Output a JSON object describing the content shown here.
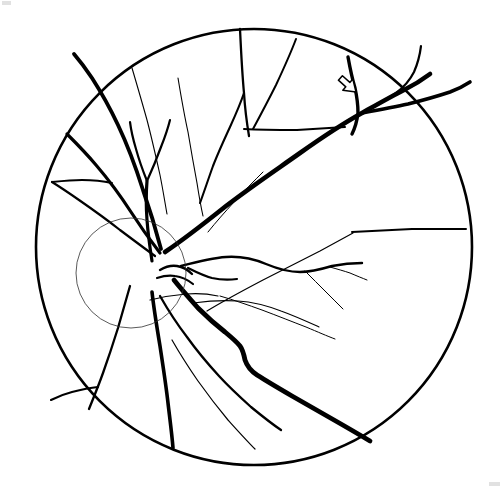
{
  "figure": {
    "title": "Retinal fundus schematic drawing",
    "type": "line-diagram",
    "background_color": "#ffffff",
    "ink_color": "#000000",
    "canvas": {
      "width": 502,
      "height": 489
    }
  },
  "structures": {
    "fundus_boundary": {
      "label": "fundus-circle",
      "center_x": 254,
      "center_y": 247,
      "radius": 218,
      "stroke_width": 2.6,
      "color": "#000000"
    },
    "optic_disc": {
      "label": "optic-disc",
      "center_x": 131,
      "center_y": 273,
      "radius": 55,
      "stroke_width": 1,
      "color": "#2b2b2b"
    },
    "annotation_arrow": {
      "label": "arrow-pointer",
      "tip_x": 356,
      "tip_y": 92,
      "direction": "down-right",
      "style": "hollow-outline",
      "fill": "#ffffff",
      "stroke": "#000000"
    }
  },
  "vessels": {
    "thick_stroke_width": 4.2,
    "medium_stroke_width": 2.2,
    "thin_stroke_width": 1.0,
    "paths": [
      {
        "name": "superotemporal-arcade-major",
        "weight": "thick",
        "width": 4.6,
        "d": "M 165 252 C 186 238 206 222 226 206 C 252 186 276 170 300 153 C 324 136 344 123 362 113 C 378 104 392 96 404 90 C 414 85 422 80 430 74"
      },
      {
        "name": "superotemporal-branch-upper",
        "weight": "medium",
        "width": 2.2,
        "d": "M 362 113 C 374 107 386 100 396 93 C 404 87 410 80 414 72 C 418 63 420 54 421 46"
      },
      {
        "name": "superotemporal-branch-to-periphery",
        "weight": "thick",
        "width": 3.6,
        "d": "M 362 113 C 378 110 394 107 408 104 C 424 100 438 96 450 92 C 458 89 464 86 470 82"
      },
      {
        "name": "arrow-target-vessel",
        "weight": "thick",
        "width": 3.4,
        "d": "M 348 57 C 350 68 352 78 355 88 C 357 97 358 105 358 113 C 357 121 355 128 352 134"
      },
      {
        "name": "superior-trunk-vertical",
        "weight": "medium",
        "width": 2.3,
        "d": "M 240 29 C 241 50 242 72 244 93 C 245 110 247 124 249 136"
      },
      {
        "name": "superior-trunk-fan-left",
        "weight": "medium",
        "width": 2.1,
        "d": "M 244 93 C 240 105 235 116 230 127 C 224 140 218 153 213 166 C 208 180 204 192 200 203"
      },
      {
        "name": "superior-horizontal-connector",
        "weight": "medium",
        "width": 2.0,
        "d": "M 244 129 C 262 130 280 130 297 130 C 315 129 331 128 345 127"
      },
      {
        "name": "superior-oblique-branch",
        "weight": "medium",
        "width": 2.0,
        "d": "M 296 39 C 290 55 283 70 276 85 C 268 101 260 116 253 129"
      },
      {
        "name": "nasal-superior-arcade",
        "weight": "thick",
        "width": 3.8,
        "d": "M 161 249 C 156 230 150 210 143 190 C 136 168 128 146 118 125 C 110 108 101 92 92 78 C 86 69 80 61 74 54"
      },
      {
        "name": "nasal-superior-secondary",
        "weight": "thick",
        "width": 3.2,
        "d": "M 160 253 C 150 240 140 226 131 212 C 120 195 108 179 96 165 C 86 153 76 143 67 134"
      },
      {
        "name": "nasal-superior-tertiary",
        "weight": "medium",
        "width": 2.2,
        "d": "M 155 256 C 144 248 132 239 120 230 C 106 219 92 209 79 200 C 69 193 60 187 52 182"
      },
      {
        "name": "nasal-midline-branch",
        "weight": "medium",
        "width": 2.0,
        "d": "M 52 182 C 62 181 72 180 82 180 C 93 180 103 181 112 183"
      },
      {
        "name": "nasal-thin-branch-a",
        "weight": "thin",
        "width": 1.1,
        "d": "M 132 68 C 137 85 142 102 147 120 C 152 139 156 157 160 175 C 163 190 165 203 167 214"
      },
      {
        "name": "nasal-thin-branch-b",
        "weight": "thin",
        "width": 1.1,
        "d": "M 178 78 C 181 96 184 114 188 132 C 191 150 194 167 197 183 C 199 196 201 207 203 216"
      },
      {
        "name": "macular-superior-horizontal",
        "weight": "medium",
        "width": 2.4,
        "d": "M 181 266 C 196 262 211 258 226 257 C 241 256 254 259 266 264 C 278 269 289 272 300 272 C 312 272 322 269 332 266 C 342 264 352 263 362 263"
      },
      {
        "name": "macular-thin-upper",
        "weight": "thin",
        "width": 1.0,
        "d": "M 305 271 C 312 278 319 285 326 292 C 332 298 338 304 343 309"
      },
      {
        "name": "macular-thin-upper-2",
        "weight": "thin",
        "width": 1.0,
        "d": "M 330 267 C 337 269 344 271 350 273 C 357 276 362 278 367 280"
      },
      {
        "name": "inferotemporal-arcade-major",
        "weight": "thick",
        "width": 4.8,
        "d": "M 174 280 C 182 290 190 299 198 308 C 207 317 216 325 225 332 C 231 337 236 341 240 346 C 243 350 244 355 245 360 C 247 366 251 371 257 375 C 268 382 280 389 292 396 C 306 404 320 412 334 420 C 348 428 360 435 370 441"
      },
      {
        "name": "inferotemporal-thin-upper",
        "weight": "thin",
        "width": 1.1,
        "d": "M 193 303 C 208 301 223 300 238 301 C 254 302 268 306 281 311 C 295 316 308 322 319 327"
      },
      {
        "name": "inferotemporal-thin-lower",
        "weight": "thin",
        "width": 1.0,
        "d": "M 220 296 C 234 300 248 305 262 310 C 278 316 293 322 306 327 C 318 332 327 336 335 339"
      },
      {
        "name": "inferior-branch-mid",
        "weight": "medium",
        "width": 2.3,
        "d": "M 160 296 C 168 310 177 324 187 337 C 197 351 208 364 219 376 C 230 388 241 398 251 407 C 262 416 272 424 281 430"
      },
      {
        "name": "inferior-branch-thin",
        "weight": "thin",
        "width": 1.2,
        "d": "M 172 340 C 180 354 189 368 198 381 C 208 395 218 408 228 420 C 238 431 247 441 255 449"
      },
      {
        "name": "inferior-nasal-arcade",
        "weight": "thick",
        "width": 3.6,
        "d": "M 152 292 C 154 310 157 328 160 346 C 163 366 166 385 168 403 C 170 420 172 435 173 448"
      },
      {
        "name": "inferior-nasal-branch-left",
        "weight": "medium",
        "width": 2.3,
        "d": "M 130 286 C 126 300 122 314 118 328 C 113 344 108 359 103 373 C 98 387 93 399 89 409"
      },
      {
        "name": "inferior-nasal-connector",
        "weight": "medium",
        "width": 2.1,
        "d": "M 98 387 C 89 388 80 390 72 392 C 64 394 57 397 51 400"
      },
      {
        "name": "disc-emergent-up",
        "weight": "thick",
        "width": 3.2,
        "d": "M 152 261 C 150 248 148 234 147 220 C 146 206 146 193 147 181"
      },
      {
        "name": "disc-emergent-up-fork",
        "weight": "medium",
        "width": 2.2,
        "d": "M 147 181 C 143 171 139 160 136 149 C 133 139 131 130 130 122"
      },
      {
        "name": "disc-emergent-up-fork-2",
        "weight": "medium",
        "width": 2.2,
        "d": "M 147 181 C 152 170 157 158 161 147 C 165 137 168 128 170 120"
      },
      {
        "name": "disc-center-loop",
        "weight": "medium",
        "width": 2.4,
        "d": "M 160 270 C 165 267 171 265 177 266 C 183 267 188 270 192 274"
      },
      {
        "name": "disc-center-loop-2",
        "weight": "medium",
        "width": 2.2,
        "d": "M 157 278 C 163 276 169 275 175 276 C 182 277 188 280 193 284"
      },
      {
        "name": "disc-emergent-temporal-thin",
        "weight": "thin",
        "width": 1.2,
        "d": "M 150 300 C 162 297 174 295 186 294 C 198 293 209 294 218 296"
      },
      {
        "name": "macular-upper-hook",
        "weight": "medium",
        "width": 2.2,
        "d": "M 188 268 C 196 272 204 276 212 278 C 221 280 229 280 237 279"
      },
      {
        "name": "temporal-periphery-long-thin",
        "weight": "thin",
        "width": 1.2,
        "d": "M 207 311 C 225 300 244 290 263 280 C 283 270 302 260 320 251 C 333 244 344 238 353 233"
      },
      {
        "name": "temporal-horizontal-periphery",
        "weight": "medium",
        "width": 2.0,
        "d": "M 352 232 C 372 231 392 230 412 229 C 432 229 450 229 466 229"
      },
      {
        "name": "superior-thin-peripheral",
        "weight": "thin",
        "width": 1.0,
        "d": "M 208 232 C 216 222 225 212 234 202 C 244 191 254 181 263 172"
      }
    ]
  },
  "corner_artifacts": [
    {
      "name": "top-left-scan-mark",
      "x": 2,
      "y": 1,
      "width": 9,
      "height": 4
    },
    {
      "name": "bottom-right-scan-mark",
      "x": 489,
      "y": 482,
      "width": 11,
      "height": 4
    }
  ]
}
